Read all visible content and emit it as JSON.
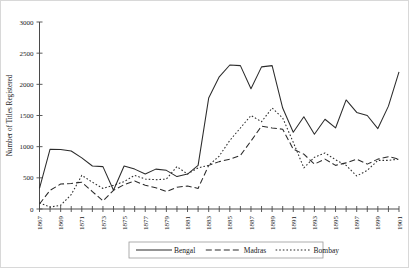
{
  "chart_data": {
    "type": "line",
    "title": "",
    "xlabel": "",
    "ylabel": "Number of Titles Registered",
    "xlim": [
      1867,
      1901
    ],
    "ylim": [
      0,
      3000
    ],
    "yticks": [
      0,
      500,
      1000,
      1500,
      2000,
      2500,
      3000
    ],
    "ytick_labels": [
      "0",
      "500",
      "1000",
      "1500",
      "2000",
      "2500",
      "3000"
    ],
    "x": [
      1867,
      1868,
      1869,
      1870,
      1871,
      1872,
      1873,
      1874,
      1875,
      1876,
      1877,
      1878,
      1879,
      1880,
      1881,
      1882,
      1883,
      1884,
      1885,
      1886,
      1887,
      1888,
      1889,
      1890,
      1891,
      1892,
      1893,
      1894,
      1895,
      1896,
      1897,
      1898,
      1899,
      1900,
      1901
    ],
    "xtick_labels": [
      "1867",
      "1869",
      "1871",
      "1873",
      "1875",
      "1877",
      "1879",
      "1881",
      "1883",
      "1885",
      "1887",
      "1889",
      "1891",
      "1893",
      "1895",
      "1897",
      "1899",
      "1901"
    ],
    "xtick_values": [
      1867,
      1869,
      1871,
      1873,
      1875,
      1877,
      1879,
      1881,
      1883,
      1885,
      1887,
      1889,
      1891,
      1893,
      1895,
      1897,
      1899,
      1901
    ],
    "grid": false,
    "legend_position": "below-axes",
    "series": [
      {
        "name": "Bengal",
        "style": "solid",
        "values": [
          330,
          960,
          955,
          930,
          820,
          690,
          680,
          300,
          690,
          640,
          560,
          640,
          620,
          520,
          560,
          700,
          1780,
          2120,
          2310,
          2300,
          1930,
          2280,
          2300,
          1620,
          1230,
          1480,
          1200,
          1440,
          1300,
          1750,
          1550,
          1500,
          1290,
          1650,
          2200
        ]
      },
      {
        "name": "Madras",
        "style": "dashed",
        "values": [
          80,
          300,
          400,
          410,
          430,
          280,
          130,
          300,
          390,
          450,
          380,
          340,
          280,
          350,
          370,
          330,
          700,
          760,
          800,
          860,
          1090,
          1330,
          1300,
          1280,
          960,
          880,
          720,
          800,
          700,
          740,
          800,
          720,
          800,
          840,
          800
        ]
      },
      {
        "name": "Bombay",
        "style": "dotted",
        "values": [
          100,
          30,
          60,
          230,
          540,
          430,
          330,
          380,
          440,
          540,
          480,
          470,
          480,
          680,
          560,
          660,
          700,
          850,
          1100,
          1300,
          1500,
          1400,
          1620,
          1460,
          1070,
          660,
          830,
          900,
          790,
          700,
          530,
          620,
          780,
          780,
          800
        ]
      }
    ]
  },
  "legend": {
    "items": [
      {
        "label": "Bengal",
        "style": "solid"
      },
      {
        "label": "Madras",
        "style": "dashed"
      },
      {
        "label": "Bombay",
        "style": "dotted"
      }
    ]
  },
  "colors": {
    "line": "#2b2b2b",
    "axis": "#4a4a4a",
    "text": "#1a1a1a",
    "frame": "#d8d8d8",
    "background": "#ffffff"
  }
}
